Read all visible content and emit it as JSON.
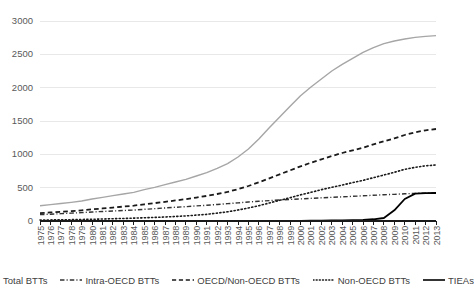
{
  "chart_data": {
    "type": "line",
    "title": "",
    "xlabel": "",
    "ylabel": "",
    "ylim": [
      0,
      3000
    ],
    "ytick_values": [
      0,
      500,
      1000,
      1500,
      2000,
      2500,
      3000
    ],
    "ytick_labels": [
      "0",
      "500",
      "1000",
      "1500",
      "2000",
      "2500",
      "3000"
    ],
    "grid": true,
    "legend_position": "bottom",
    "x": [
      1975,
      1976,
      1977,
      1978,
      1979,
      1980,
      1981,
      1982,
      1983,
      1984,
      1985,
      1986,
      1987,
      1988,
      1989,
      1990,
      1991,
      1992,
      1993,
      1994,
      1995,
      1996,
      1997,
      1998,
      1999,
      2000,
      2001,
      2002,
      2003,
      2004,
      2005,
      2006,
      2007,
      2008,
      2009,
      2010,
      2011,
      2012,
      2013
    ],
    "xtick_labels": [
      "1975",
      "1976",
      "1977",
      "1978",
      "1979",
      "1980",
      "1981",
      "1982",
      "1983",
      "1984",
      "1985",
      "1986",
      "1987",
      "1988",
      "1989",
      "1990",
      "1991",
      "1992",
      "1993",
      "1994",
      "1995",
      "1996",
      "1997",
      "1998",
      "1999",
      "2000",
      "2001",
      "2002",
      "2003",
      "2004",
      "2005",
      "2006",
      "2007",
      "2008",
      "2009",
      "2010",
      "2011",
      "2012",
      "2013"
    ],
    "series": [
      {
        "name": "Total BTTs",
        "style": "solid",
        "color": "#a6a6a6",
        "width": 1.4,
        "values": [
          228,
          245,
          262,
          280,
          300,
          330,
          355,
          380,
          405,
          430,
          470,
          505,
          545,
          585,
          625,
          675,
          725,
          790,
          860,
          960,
          1080,
          1230,
          1400,
          1560,
          1720,
          1880,
          2010,
          2130,
          2250,
          2350,
          2440,
          2530,
          2600,
          2660,
          2700,
          2730,
          2755,
          2770,
          2780
        ]
      },
      {
        "name": "Intra-OECD BTTs",
        "style": "dashdot",
        "color": "#333333",
        "width": 1.4,
        "values": [
          95,
          102,
          110,
          118,
          126,
          135,
          143,
          150,
          157,
          164,
          175,
          185,
          196,
          206,
          215,
          226,
          236,
          248,
          260,
          272,
          285,
          296,
          306,
          315,
          323,
          331,
          340,
          348,
          355,
          362,
          370,
          378,
          386,
          394,
          400,
          408,
          414,
          418,
          420
        ]
      },
      {
        "name": "OECD/Non-OECD BTTs",
        "style": "dash",
        "color": "#1a1a1a",
        "width": 1.8,
        "values": [
          118,
          128,
          138,
          148,
          160,
          175,
          188,
          202,
          216,
          230,
          250,
          268,
          288,
          308,
          328,
          352,
          376,
          405,
          436,
          478,
          525,
          580,
          640,
          700,
          760,
          820,
          875,
          925,
          975,
          1020,
          1060,
          1100,
          1150,
          1195,
          1240,
          1290,
          1330,
          1360,
          1380
        ]
      },
      {
        "name": "Non-OECD BTTs",
        "style": "dot",
        "color": "#1a1a1a",
        "width": 1.6,
        "values": [
          14,
          16,
          18,
          20,
          23,
          26,
          30,
          34,
          38,
          43,
          48,
          54,
          60,
          68,
          76,
          88,
          100,
          118,
          138,
          165,
          195,
          230,
          270,
          310,
          350,
          392,
          430,
          470,
          505,
          540,
          575,
          610,
          650,
          690,
          730,
          775,
          805,
          828,
          840
        ]
      },
      {
        "name": "TIEAs",
        "style": "solid",
        "color": "#000000",
        "width": 1.8,
        "values": [
          0,
          0,
          0,
          0,
          0,
          0,
          0,
          0,
          0,
          0,
          0,
          0,
          0,
          0,
          0,
          0,
          0,
          0,
          0,
          0,
          0,
          0,
          0,
          1,
          2,
          3,
          4,
          6,
          8,
          10,
          14,
          18,
          26,
          45,
          160,
          330,
          410,
          418,
          420
        ]
      }
    ]
  },
  "legend": {
    "items": [
      {
        "label": "Total BTTs",
        "style": "solid",
        "color": "#a6a6a6"
      },
      {
        "label": "Intra-OECD BTTs",
        "style": "dashdot",
        "color": "#333333"
      },
      {
        "label": "OECD/Non-OECD BTTs",
        "style": "dash",
        "color": "#1a1a1a"
      },
      {
        "label": "Non-OECD BTTs",
        "style": "dot",
        "color": "#1a1a1a"
      },
      {
        "label": "TIEAs",
        "style": "solid",
        "color": "#000000"
      }
    ]
  },
  "axes": {
    "grid_color": "#e8e8e8",
    "baseline_color": "#1a1a1a",
    "tick_color": "#1a1a1a",
    "label_color": "#595959"
  }
}
